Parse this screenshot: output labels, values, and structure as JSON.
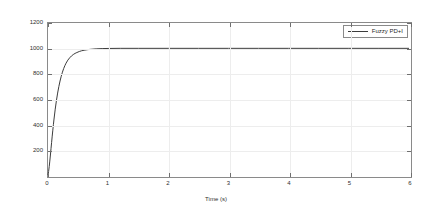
{
  "chart_data": {
    "type": "line",
    "title": "",
    "xlabel": "Time (s)",
    "ylabel": "Speed (rad/s)",
    "xlim": [
      0,
      6
    ],
    "ylim": [
      0,
      1200
    ],
    "xticks": [
      0,
      1,
      2,
      3,
      4,
      5,
      6
    ],
    "yticks": [
      0,
      200,
      400,
      600,
      800,
      1000,
      1200
    ],
    "xtick_labels": [
      "0",
      "1",
      "2",
      "3",
      "4",
      "5",
      "6"
    ],
    "ytick_labels": [
      "",
      "200",
      "400",
      "600",
      "800",
      "1000",
      "1200"
    ],
    "grid": true,
    "legend_position": "upper right",
    "line_color": "#3c3c3c",
    "grid_color": "#ededed",
    "axis_color": "#8a8a8a",
    "series": [
      {
        "name": "Fuzzy PD+I",
        "color": "#3c3c3c",
        "x": [
          0,
          0.01,
          0.02,
          0.03,
          0.04,
          0.05,
          0.06,
          0.07,
          0.08,
          0.09,
          0.1,
          0.12,
          0.14,
          0.16,
          0.18,
          0.2,
          0.22,
          0.24,
          0.26,
          0.28,
          0.3,
          0.33,
          0.36,
          0.39,
          0.42,
          0.45,
          0.48,
          0.52,
          0.56,
          0.6,
          0.65,
          0.7,
          0.8,
          0.9,
          1.0,
          1.2,
          1.5,
          2.0,
          2.5,
          3.0,
          3.5,
          4.0,
          4.5,
          5.0,
          5.5,
          6.0
        ],
        "y": [
          0,
          28,
          66,
          110,
          158,
          208,
          258,
          307,
          354,
          399,
          442,
          520,
          588,
          647,
          698,
          742,
          780,
          812,
          840,
          863,
          883,
          907,
          925,
          940,
          951,
          960,
          967,
          975,
          981,
          985,
          989,
          992,
          996,
          998,
          999,
          1000,
          1000,
          1000,
          1000,
          1000,
          1000,
          1000,
          1000,
          1000,
          1000,
          1000
        ]
      }
    ],
    "annotations": {
      "steady_state_value": 1000,
      "settling_time_approx": 0.6,
      "overshoot": 0
    }
  },
  "legend": {
    "entries": [
      {
        "label": "Fuzzy PD+I"
      }
    ]
  }
}
